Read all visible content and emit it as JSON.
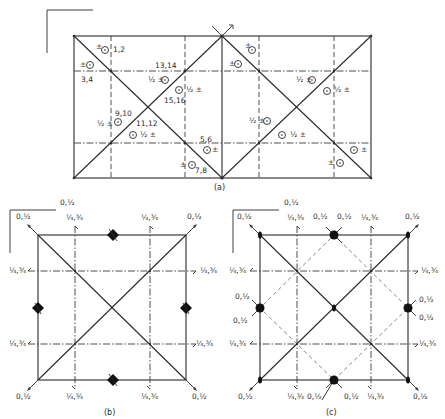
{
  "figure": {
    "panels": [
      {
        "id": "a",
        "caption": "(a)",
        "symbols": [
          {
            "sign": "±",
            "label": "1,2"
          },
          {
            "sign": "±",
            "label": "3,4"
          },
          {
            "sign": "½ ±",
            "label": "13,14"
          },
          {
            "sign": "½ ±",
            "label": "15,16"
          },
          {
            "sign": "½ ±",
            "label": "9,10"
          },
          {
            "sign": "½ ±",
            "label": "11,12"
          },
          {
            "sign": "±",
            "label": "5,6"
          },
          {
            "sign": "±",
            "label": "7,8"
          }
        ]
      },
      {
        "id": "b",
        "caption": "(b)",
        "corner_label": "0,½",
        "axis_labels": {
          "corners": "0,½",
          "screw_axes": "¼,¾"
        }
      },
      {
        "id": "c",
        "caption": "(c)",
        "corner_label": "0,½",
        "axis_labels": {
          "corners": "0,½",
          "screw_axes": "¼,¾",
          "edge_midpoints": "0,½"
        }
      }
    ]
  },
  "labels": {
    "a_pm_1": "±",
    "a_lab_1": "1,2",
    "a_pm_2": "±",
    "a_lab_2": "3,4",
    "a_lab_13": "13,14",
    "a_half_13": "½ ±",
    "a_lab_15": "15,16",
    "a_half_15": "½ ±",
    "a_lab_9": "9,10",
    "a_half_9": "½ ±",
    "a_lab_11": "11,12",
    "a_half_11": "½ ±",
    "a_lab_5": "5,6",
    "a_pm_5": "±",
    "a_lab_7": "7,8",
    "a_pm_7": "±",
    "r_pm_1": "±",
    "r_pm_2": "±",
    "r_half_13": "½ ±",
    "r_half_15": "½ ±",
    "r_half_9": "½ ±",
    "r_half_11": "½ ±",
    "r_pm_5": "±",
    "r_pm_7": "±",
    "zero_half": "0,½",
    "quarter": "¼,¾",
    "cap_a": "(a)",
    "cap_b": "(b)",
    "cap_c": "(c)"
  }
}
